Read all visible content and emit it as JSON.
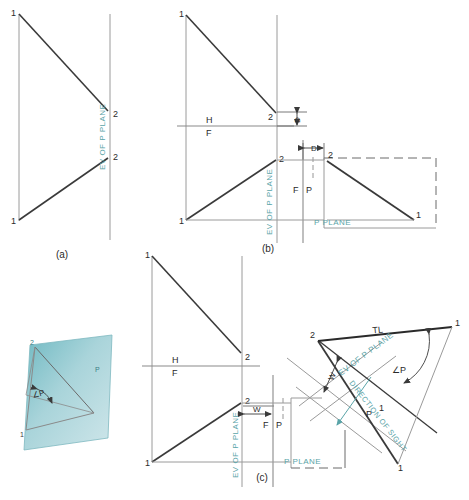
{
  "figure": {
    "domain": "technical-drawing",
    "colors": {
      "line": "#3a3a3a",
      "thin": "#8a8a8a",
      "teal": "#5aa4a8",
      "plane_fill_a": "#7fc4c9",
      "plane_fill_b": "#cfe3e6",
      "background": "#ffffff"
    },
    "panels": [
      {
        "key": "a",
        "caption": "(a)"
      },
      {
        "key": "b",
        "caption": "(b)"
      },
      {
        "key": "c",
        "caption": "(c)"
      }
    ],
    "labels": {
      "point_1": "1",
      "point_2": "2",
      "h": "H",
      "f": "F",
      "p": "P",
      "fp_f": "F",
      "fp_p": "P",
      "ev_of_p_plane": "EV OF P PLANE",
      "p_plane": "P PLANE",
      "true_length": "TL",
      "angle_p": "∠P",
      "dim_d": "D",
      "dim_w": "W",
      "direction_of_sight": "DIRECTION OF SIGHT",
      "pictorial_angle": "∠P",
      "pictorial_point_1": "1",
      "pictorial_point_2": "2",
      "pictorial_plane": "P"
    },
    "panel_a": {
      "caption": "(a)",
      "top_view": {
        "p1": "1",
        "p2": "2"
      },
      "front_view": {
        "p1": "1",
        "p2": "2"
      },
      "ev_label": "EV OF P PLANE"
    },
    "panel_b": {
      "caption": "(b)",
      "fold_line_h": "H",
      "fold_line_f": "F",
      "fold_line_fp_f": "F",
      "fold_line_fp_p": "P",
      "ev_label": "EV OF P PLANE",
      "p_plane_label": "P PLANE",
      "dimension": "D",
      "top_view": {
        "p1": "1",
        "p2": "2"
      },
      "front_view": {
        "p1": "1",
        "p2": "2"
      },
      "profile_view": {
        "p1": "1",
        "p2": "2"
      }
    },
    "panel_c": {
      "caption": "(c)",
      "fold_line_h": "H",
      "fold_line_f": "F",
      "fold_line_fp_f": "F",
      "fold_line_fp_p": "P",
      "ev_label": "EV OF P PLANE",
      "ev_label_rotated": "EV OF P PLANE",
      "p_plane_label": "P PLANE",
      "dimension_w_front": "W",
      "dimension_w_aux": "W",
      "direction_of_sight": "DIRECTION OF SIGHT",
      "true_length": "TL",
      "angle_p": "∠P",
      "p_mark": "P",
      "top_view": {
        "p1": "1",
        "p2": "2"
      },
      "front_view": {
        "p1": "1",
        "p2": "2"
      },
      "aux_view": {
        "p1": "1",
        "p2": "2"
      }
    },
    "pictorial": {
      "angle_label": "∠P",
      "point_1": "1",
      "point_2": "2",
      "plane_label": "P"
    }
  }
}
